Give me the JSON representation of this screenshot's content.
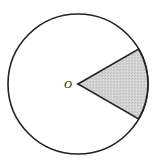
{
  "diagram": {
    "type": "circle-sector",
    "center_label": "O",
    "circle": {
      "cx": 78,
      "cy": 84,
      "r": 70,
      "stroke": "#222222",
      "stroke_width": 1.6,
      "fill": "#ffffff"
    },
    "sector": {
      "center_angle_deg": 0,
      "span_deg": 60,
      "start_point": [
        136,
        50
      ],
      "end_point": [
        136,
        118
      ],
      "fill": "#cfcfcf",
      "stroke": "#222222",
      "stroke_width": 1.6
    },
    "label_position": {
      "x": 64,
      "y": 79
    }
  }
}
